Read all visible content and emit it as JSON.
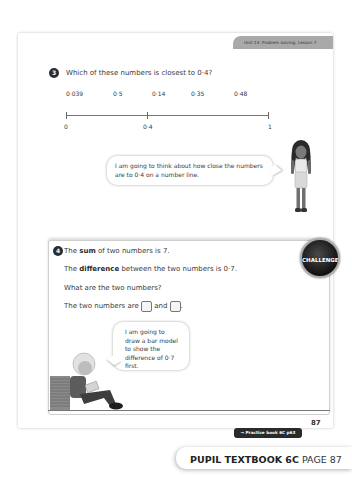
{
  "header": {
    "unit_label": "Unit 14: Problem solving, Lesson 7"
  },
  "question3": {
    "number": "3",
    "prompt": "Which of these numbers is closest to 0·4?",
    "options": [
      "0·039",
      "0·5",
      "0·14",
      "0·35",
      "0·48"
    ],
    "number_line": {
      "labels": [
        "0",
        "0·4",
        "1"
      ]
    },
    "speech_bubble": "I am going to think about how close the numbers are to 0·4 on a number line."
  },
  "question4": {
    "number": "4",
    "line1_pre": "The ",
    "line1_bold": "sum",
    "line1_post": " of two numbers is 7.",
    "line2_pre": "The ",
    "line2_bold": "difference",
    "line2_post": " between the two numbers is 0·7.",
    "line3": "What are the two numbers?",
    "line4_pre": "The two numbers are",
    "line4_and": "and",
    "line4_end": ".",
    "badge": "CHALLENGE",
    "speech_bubble": "I am going to draw a bar model to show the difference of 0·7 first."
  },
  "footer": {
    "practice_link": "→ Practice book 6C p63",
    "page_number": "87",
    "book_title": "PUPIL TEXTBOOK 6C",
    "page_label": "PAGE 87"
  },
  "colors": {
    "tab_gray": "#a9a9a9",
    "badge_dark": "#1a1a1a",
    "text": "#3a3a3a"
  }
}
